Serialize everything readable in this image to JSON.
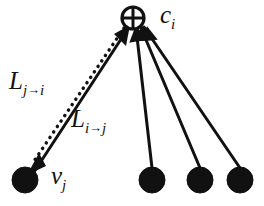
{
  "figure": {
    "width": 264,
    "height": 206,
    "background_color": "#ffffff",
    "stroke_color": "#111111"
  },
  "nodes": [
    {
      "id": "c_i",
      "kind": "check-node",
      "glyph": "circled-plus-icon",
      "label_base": "c",
      "label_sub": "i",
      "label_text": "c_i",
      "cx": 133,
      "cy": 18,
      "r": 11,
      "fill": "#ffffff",
      "stroke": "#111111"
    },
    {
      "id": "v_j",
      "kind": "variable-node",
      "glyph": "filled-circle-icon",
      "label_base": "v",
      "label_sub": "j",
      "label_text": "v_j",
      "cx": 25,
      "cy": 180,
      "r": 13,
      "fill": "#111111",
      "stroke": "#111111"
    },
    {
      "id": "v_2",
      "kind": "variable-node",
      "glyph": "filled-circle-icon",
      "label_text": "",
      "cx": 152,
      "cy": 180,
      "r": 13,
      "fill": "#111111",
      "stroke": "#111111"
    },
    {
      "id": "v_3",
      "kind": "variable-node",
      "glyph": "filled-circle-icon",
      "label_text": "",
      "cx": 200,
      "cy": 180,
      "r": 13,
      "fill": "#111111",
      "stroke": "#111111"
    },
    {
      "id": "v_4",
      "kind": "variable-node",
      "glyph": "filled-circle-icon",
      "label_text": "",
      "cx": 240,
      "cy": 180,
      "r": 13,
      "fill": "#111111",
      "stroke": "#111111"
    }
  ],
  "edges": [
    {
      "id": "edge-j-to-i",
      "from": "v_j",
      "to": "c_i",
      "style": "dotted",
      "arrow_at": "v_j",
      "direction": "c_i -> v_j",
      "label_id": "L_ji"
    },
    {
      "id": "edge-i-to-j",
      "from": "v_j",
      "to": "c_i",
      "style": "solid",
      "arrow_at": "c_i",
      "direction": "v_j -> c_i",
      "label_id": "L_ij"
    },
    {
      "id": "edge-c-v2",
      "from": "v_2",
      "to": "c_i",
      "style": "solid",
      "arrow_at": "c_i",
      "direction": "v_2 -> c_i",
      "label_id": ""
    },
    {
      "id": "edge-c-v3",
      "from": "v_3",
      "to": "c_i",
      "style": "solid",
      "arrow_at": "c_i",
      "direction": "v_3 -> c_i",
      "label_id": ""
    },
    {
      "id": "edge-c-v4",
      "from": "v_4",
      "to": "c_i",
      "style": "solid",
      "arrow_at": "c_i",
      "direction": "v_4 -> c_i",
      "label_id": ""
    }
  ],
  "labels": {
    "c_i": {
      "base": "c",
      "sub": "i"
    },
    "v_j": {
      "base": "v",
      "sub": "j"
    },
    "L_ji": {
      "base": "L",
      "sub_from": "j",
      "arrow": "→",
      "sub_to": "i",
      "text": "L_{j→i}"
    },
    "L_ij": {
      "base": "L",
      "sub_from": "i",
      "arrow": "→",
      "sub_to": "j",
      "text": "L_{i→j}"
    }
  }
}
